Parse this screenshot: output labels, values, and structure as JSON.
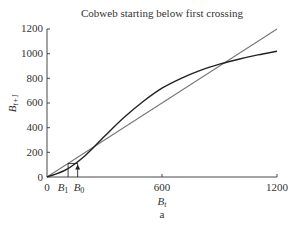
{
  "chart_data": {
    "type": "line",
    "title": "Cobweb starting below first crossing",
    "xlabel": "B_t",
    "ylabel": "B_{t+1}",
    "caption": "a",
    "xlim": [
      0,
      1200
    ],
    "ylim": [
      0,
      1200
    ],
    "xticks": [
      0,
      600,
      1200
    ],
    "yticks": [
      0,
      200,
      400,
      600,
      800,
      1000,
      1200
    ],
    "grid": false,
    "legend": null,
    "series": [
      {
        "name": "recruitment curve",
        "color": "#222222",
        "x": [
          0,
          100,
          200,
          300,
          400,
          500,
          600,
          700,
          800,
          900,
          1000,
          1100,
          1200
        ],
        "y": [
          0,
          60,
          175,
          330,
          480,
          610,
          720,
          800,
          865,
          915,
          955,
          990,
          1020
        ]
      },
      {
        "name": "replacement line (B_{t+1} = B_t)",
        "color": "#777777",
        "x": [
          0,
          1200
        ],
        "y": [
          0,
          1200
        ]
      }
    ],
    "annotations": [
      {
        "type": "cobweb",
        "start_label": "B_0",
        "start_x": 160,
        "next_label": "B_1",
        "next_x": 110,
        "level": 110
      },
      {
        "type": "crossing",
        "label": "lower equilibrium",
        "x": 220,
        "y": 220
      },
      {
        "type": "crossing",
        "label": "upper equilibrium",
        "x": 940,
        "y": 940
      }
    ],
    "axis_extra_labels": [
      "B_1",
      "B_0"
    ]
  },
  "labels": {
    "title": "Cobweb starting below first crossing",
    "xlabel_main": "B",
    "xlabel_sub": "t",
    "ylabel_main": "B",
    "ylabel_sub": "t+1",
    "caption": "a",
    "b1_main": "B",
    "b1_sub": "1",
    "b0_main": "B",
    "b0_sub": "0",
    "x_tick_0": "0",
    "x_tick_600": "600",
    "x_tick_1200": "1200",
    "y_tick_0": "0",
    "y_tick_200": "200",
    "y_tick_400": "400",
    "y_tick_600": "600",
    "y_tick_800": "800",
    "y_tick_1000": "1000",
    "y_tick_1200": "1200"
  }
}
